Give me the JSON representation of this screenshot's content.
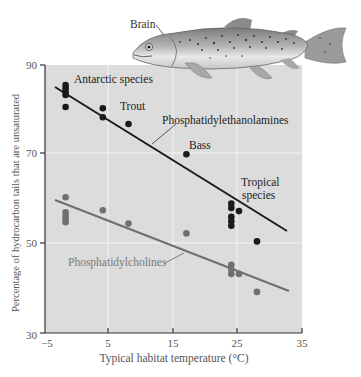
{
  "chart_data": {
    "type": "scatter",
    "title": "",
    "xlabel": "Typical habitat temperature (°C)",
    "ylabel": "Percentage of hydrocarbon tails that are unsaturated",
    "xlim": [
      -5,
      35
    ],
    "ylim": [
      30,
      90
    ],
    "xticks": [
      -5,
      5,
      15,
      25,
      35
    ],
    "yticks": [
      30,
      50,
      70,
      90
    ],
    "grid": true,
    "series": [
      {
        "name": "Phosphatidylethanolamines",
        "color": "#1a1a1a",
        "points": [
          {
            "x": -1.8,
            "y": 85.5
          },
          {
            "x": -1.8,
            "y": 84.8
          },
          {
            "x": -1.8,
            "y": 84.0
          },
          {
            "x": -1.8,
            "y": 83.3
          },
          {
            "x": -1.8,
            "y": 80.6
          },
          {
            "x": 4.0,
            "y": 80.3
          },
          {
            "x": 4.0,
            "y": 78.3
          },
          {
            "x": 8.0,
            "y": 76.8
          },
          {
            "x": 17.0,
            "y": 70.0
          },
          {
            "x": 24.0,
            "y": 59.0
          },
          {
            "x": 24.0,
            "y": 58.0
          },
          {
            "x": 24.0,
            "y": 56.0
          },
          {
            "x": 24.0,
            "y": 55.0
          },
          {
            "x": 24.0,
            "y": 54.0
          },
          {
            "x": 25.2,
            "y": 57.3
          },
          {
            "x": 28.0,
            "y": 50.5
          }
        ],
        "fit_line": {
          "x": [
            -3.5,
            33.0
          ],
          "y": [
            84.8,
            52.8
          ]
        }
      },
      {
        "name": "Phosphatidylcholines",
        "color": "#707070",
        "points": [
          {
            "x": -1.8,
            "y": 60.4
          },
          {
            "x": -1.8,
            "y": 57.0
          },
          {
            "x": -1.8,
            "y": 56.2
          },
          {
            "x": -1.8,
            "y": 55.5
          },
          {
            "x": -1.8,
            "y": 54.8
          },
          {
            "x": 4.0,
            "y": 57.5
          },
          {
            "x": 8.0,
            "y": 54.5
          },
          {
            "x": 17.0,
            "y": 52.3
          },
          {
            "x": 24.0,
            "y": 45.3
          },
          {
            "x": 24.0,
            "y": 44.2
          },
          {
            "x": 24.0,
            "y": 43.2
          },
          {
            "x": 25.2,
            "y": 43.2
          },
          {
            "x": 28.0,
            "y": 39.2
          }
        ],
        "fit_line": {
          "x": [
            -3.5,
            33.0
          ],
          "y": [
            59.3,
            39.5
          ]
        }
      }
    ],
    "annotations": [
      {
        "text": "Antarctic species",
        "x": 0.0,
        "y": 85.2
      },
      {
        "text": "Trout",
        "x": 9.0,
        "y": 80.0
      },
      {
        "text": "Phosphatidylethanolamines",
        "x": 16.5,
        "y": 74.5
      },
      {
        "text": "Bass",
        "x": 16.0,
        "y": 72.5
      },
      {
        "text": "Tropical species",
        "x": 25.5,
        "y": 62.0
      },
      {
        "text": "Phosphatidylcholines",
        "x": 0.0,
        "y": 45.5
      },
      {
        "text": "Brain",
        "x": null,
        "y": null
      }
    ]
  },
  "labels": {
    "brain": "Brain",
    "antarctic": "Antarctic species",
    "trout": "Trout",
    "pe": "Phosphatidylethanolamines",
    "bass": "Bass",
    "tropical1": "Tropical",
    "tropical2": "species",
    "pc": "Phosphatidylcholines",
    "xlabel": "Typical habitat temperature (°C)",
    "ylabel": "Percentage of hydrocarbon tails that are unsaturated",
    "xt0": "−5",
    "xt1": "5",
    "xt2": "15",
    "xt3": "25",
    "xt4": "35",
    "yt0": "30",
    "yt1": "50",
    "yt2": "70",
    "yt3": "90"
  },
  "colors": {
    "plot_bg": "#dcdcdc",
    "grid": "#f4f4f4",
    "pe_color": "#1a1a1a",
    "pc_color": "#707070",
    "pc_line": "#6e6e6e"
  }
}
